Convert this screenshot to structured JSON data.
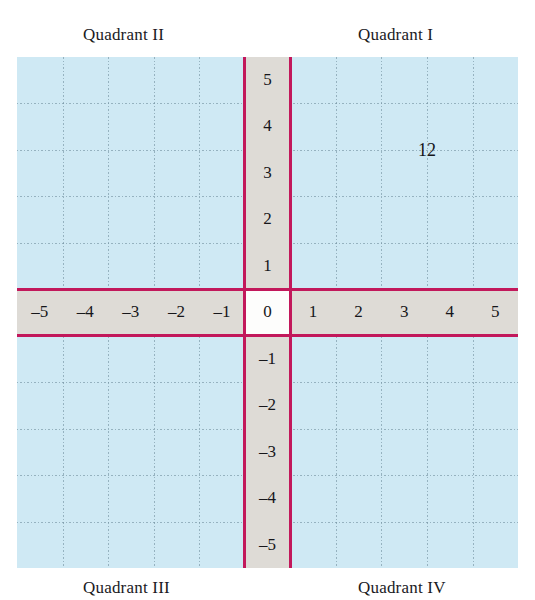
{
  "figure": {
    "background_color": "#ffffff"
  },
  "quadrant_labels": {
    "q1": "Quadrant I",
    "q2": "Quadrant II",
    "q3": "Quadrant III",
    "q4": "Quadrant IV"
  },
  "annotations": [
    {
      "text": "12",
      "x": 3.5,
      "y": 3.5
    }
  ],
  "chart_data": {
    "type": "scatter",
    "title": "",
    "xlabel": "",
    "ylabel": "",
    "xlim": [
      -5.5,
      5.5
    ],
    "ylim": [
      -5.5,
      5.5
    ],
    "grid": true,
    "legend": "none",
    "x_ticks": [
      "–5",
      "–4",
      "–3",
      "–2",
      "–1",
      "0",
      "1",
      "2",
      "3",
      "4",
      "5"
    ],
    "x_tick_values": [
      -5,
      -4,
      -3,
      -2,
      -1,
      0,
      1,
      2,
      3,
      4,
      5
    ],
    "y_ticks": [
      "5",
      "4",
      "3",
      "2",
      "1",
      "0",
      "–1",
      "–2",
      "–3",
      "–4",
      "–5"
    ],
    "y_tick_values": [
      5,
      4,
      3,
      2,
      1,
      0,
      -1,
      -2,
      -3,
      -4,
      -5
    ],
    "origin_label": "0",
    "series": [],
    "annotations": [
      {
        "text": "12",
        "x": 3.5,
        "y": 3.5
      }
    ],
    "quadrants": [
      {
        "name": "Quadrant I",
        "position": "top-right"
      },
      {
        "name": "Quadrant II",
        "position": "top-left"
      },
      {
        "name": "Quadrant III",
        "position": "bottom-left"
      },
      {
        "name": "Quadrant IV",
        "position": "bottom-right"
      }
    ]
  },
  "colors": {
    "grid_background": "#cfe9f4",
    "grid_line": "#7694a3",
    "axis_line": "#c2185b",
    "axis_band": "#dedbd6",
    "origin_cell": "#fdfdfc",
    "text": "#16161a"
  }
}
